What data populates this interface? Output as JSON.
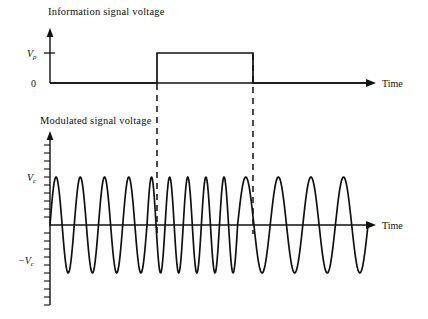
{
  "figure": {
    "background_color": "#ffffff",
    "stroke_color": "#111111",
    "width": 428,
    "height": 319
  },
  "panels": [
    {
      "id": "information-signal",
      "title": "Information signal voltage",
      "x_axis_label": "Time",
      "y_tick_labels": [
        "V",
        "0"
      ],
      "y_tick_sub": [
        "p",
        ""
      ],
      "baseline_label": "0",
      "amplitude_label": "V",
      "amplitude_sub": "p"
    },
    {
      "id": "modulated-signal",
      "title": "Modulated signal voltage",
      "x_axis_label": "Time",
      "positive_amplitude_label": "V",
      "positive_amplitude_sub": "c",
      "negative_amplitude_label": "−V",
      "negative_amplitude_sub": "c"
    }
  ],
  "chart_data": [
    {
      "type": "line",
      "id": "information-signal-voltage",
      "title": "Information signal voltage",
      "xlabel": "Time",
      "ylabel": "",
      "ylim": [
        0,
        1
      ],
      "grid": false,
      "legend": "none",
      "ytick_labels": [
        "0",
        "Vp"
      ],
      "ytick_values": [
        0,
        1
      ],
      "description": "Rectangular pulse: 0 V before t1, Vp between t1 and t2, 0 V after t2",
      "x": [
        0,
        0.305,
        0.305,
        0.59,
        0.59,
        1.0
      ],
      "values": [
        0,
        0,
        1,
        1,
        0,
        0
      ],
      "annotations": [
        {
          "text": "pulse start",
          "x": 0.305
        },
        {
          "text": "pulse end",
          "x": 0.59
        }
      ]
    },
    {
      "type": "line",
      "id": "modulated-signal-voltage",
      "title": "Modulated signal voltage",
      "xlabel": "Time",
      "ylabel": "",
      "ylim": [
        -1,
        1
      ],
      "grid": false,
      "legend": "none",
      "ytick_labels": [
        "-Vc",
        "Vc"
      ],
      "ytick_values": [
        -1,
        1
      ],
      "description": "Frequency modulated carrier: lower frequency while information signal is 0, higher frequency while information signal is Vp",
      "modulation": "frequency",
      "segments": [
        {
          "name": "low-frequency-before-pulse",
          "x_start": 0.0,
          "x_end": 0.305,
          "cycles": 4,
          "amplitude": 1
        },
        {
          "name": "high-frequency-during-pulse",
          "x_start": 0.305,
          "x_end": 0.59,
          "cycles": 5,
          "amplitude": 1
        },
        {
          "name": "low-frequency-after-pulse",
          "x_start": 0.59,
          "x_end": 1.0,
          "cycles": 4,
          "amplitude": 1
        }
      ]
    }
  ],
  "dashed_guides": {
    "count": 2,
    "label": "pulse edge guides"
  }
}
